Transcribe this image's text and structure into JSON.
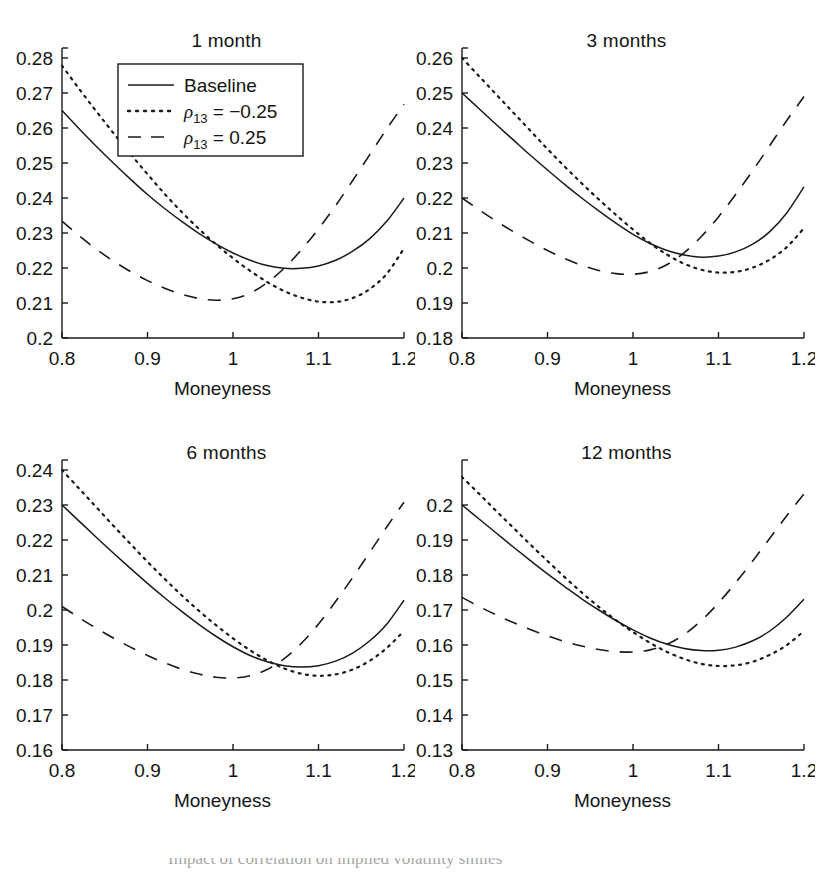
{
  "figure": {
    "background": "#ffffff",
    "line_color": "#1a1a1a",
    "caption_partial": "Impact of correlation on implied volatility smiles"
  },
  "legend": {
    "position": "upper-left-of-first-panel",
    "entries": [
      {
        "label": "Baseline",
        "style": "solid"
      },
      {
        "label": "ρ₁₃ = −0.25",
        "style": "dotted"
      },
      {
        "label": "ρ₁₃ = 0.25",
        "style": "dashed"
      }
    ],
    "entry_0_label": "Baseline",
    "entry_1_rho": "ρ",
    "entry_1_sub": "13",
    "entry_1_value": "= −0.25",
    "entry_2_rho": "ρ",
    "entry_2_sub": "13",
    "entry_2_value": "= 0.25"
  },
  "panels": {
    "p1": {
      "title": "1 month",
      "xlabel": "Moneyness",
      "xticks": [
        "0.8",
        "0.9",
        "1",
        "1.1",
        "1.2"
      ],
      "yticks": [
        "0.2",
        "0.21",
        "0.22",
        "0.23",
        "0.24",
        "0.25",
        "0.26",
        "0.27",
        "0.28"
      ]
    },
    "p2": {
      "title": "3 months",
      "xlabel": "Moneyness",
      "xticks": [
        "0.8",
        "0.9",
        "1",
        "1.1",
        "1.2"
      ],
      "yticks": [
        "0.18",
        "0.19",
        "0.2",
        "0.21",
        "0.22",
        "0.23",
        "0.24",
        "0.25",
        "0.26"
      ]
    },
    "p3": {
      "title": "6 months",
      "xlabel": "Moneyness",
      "xticks": [
        "0.8",
        "0.9",
        "1",
        "1.1",
        "1.2"
      ],
      "yticks": [
        "0.16",
        "0.17",
        "0.18",
        "0.19",
        "0.2",
        "0.21",
        "0.22",
        "0.23",
        "0.24"
      ]
    },
    "p4": {
      "title": "12 months",
      "xlabel": "Moneyness",
      "xticks": [
        "0.13",
        "0.14",
        "0.15",
        "0.16",
        "0.17",
        "0.18",
        "0.19",
        "0.2"
      ]
    }
  },
  "chart_data": [
    {
      "type": "line",
      "title": "1 month",
      "xlabel": "Moneyness",
      "ylabel": "",
      "xlim": [
        0.8,
        1.2
      ],
      "ylim": [
        0.2,
        0.28
      ],
      "xticks": [
        0.8,
        0.9,
        1.0,
        1.1,
        1.2
      ],
      "yticks": [
        0.2,
        0.21,
        0.22,
        0.23,
        0.24,
        0.25,
        0.26,
        0.27,
        0.28
      ],
      "grid": false,
      "legend": "upper-center-inside",
      "x": [
        0.8,
        0.82,
        0.84,
        0.86,
        0.88,
        0.9,
        0.92,
        0.94,
        0.96,
        0.98,
        1.0,
        1.02,
        1.04,
        1.06,
        1.08,
        1.1,
        1.12,
        1.14,
        1.16,
        1.18,
        1.2
      ],
      "series": [
        {
          "name": "Baseline",
          "style": "solid",
          "values": [
            0.265,
            0.2598,
            0.2548,
            0.25,
            0.2454,
            0.241,
            0.237,
            0.2333,
            0.2299,
            0.2269,
            0.2243,
            0.2222,
            0.2207,
            0.2199,
            0.2199,
            0.2206,
            0.2222,
            0.2248,
            0.2284,
            0.2334,
            0.24
          ]
        },
        {
          "name": "ρ₁₃ = −0.25",
          "style": "dotted",
          "values": [
            0.2778,
            0.2712,
            0.2648,
            0.2586,
            0.2526,
            0.2468,
            0.2412,
            0.236,
            0.2312,
            0.2268,
            0.2228,
            0.2192,
            0.216,
            0.2134,
            0.2115,
            0.2104,
            0.2103,
            0.2114,
            0.214,
            0.2184,
            0.2256
          ]
        },
        {
          "name": "ρ₁₃ = 0.25",
          "style": "dashed",
          "values": [
            0.2334,
            0.2292,
            0.2254,
            0.222,
            0.219,
            0.2164,
            0.2142,
            0.2125,
            0.2113,
            0.2108,
            0.2112,
            0.2128,
            0.2158,
            0.22,
            0.2252,
            0.2312,
            0.2378,
            0.245,
            0.2524,
            0.2598,
            0.2668
          ]
        }
      ]
    },
    {
      "type": "line",
      "title": "3 months",
      "xlabel": "Moneyness",
      "ylabel": "",
      "xlim": [
        0.8,
        1.2
      ],
      "ylim": [
        0.18,
        0.26
      ],
      "xticks": [
        0.8,
        0.9,
        1.0,
        1.1,
        1.2
      ],
      "yticks": [
        0.18,
        0.19,
        0.2,
        0.21,
        0.22,
        0.23,
        0.24,
        0.25,
        0.26
      ],
      "grid": false,
      "legend": "none",
      "x": [
        0.8,
        0.82,
        0.84,
        0.86,
        0.88,
        0.9,
        0.92,
        0.94,
        0.96,
        0.98,
        1.0,
        1.02,
        1.04,
        1.06,
        1.08,
        1.1,
        1.12,
        1.14,
        1.16,
        1.18,
        1.2
      ],
      "series": [
        {
          "name": "Baseline",
          "style": "solid",
          "values": [
            0.25,
            0.2455,
            0.241,
            0.2366,
            0.2322,
            0.228,
            0.2239,
            0.22,
            0.2163,
            0.2128,
            0.2096,
            0.207,
            0.205,
            0.2037,
            0.2031,
            0.2034,
            0.2046,
            0.2068,
            0.2104,
            0.2158,
            0.2232
          ]
        },
        {
          "name": "ρ₁₃ = −0.25",
          "style": "dotted",
          "values": [
            0.26,
            0.2548,
            0.2496,
            0.2444,
            0.2392,
            0.234,
            0.229,
            0.2242,
            0.2196,
            0.2152,
            0.211,
            0.2071,
            0.2038,
            0.2012,
            0.1995,
            0.1987,
            0.1989,
            0.2001,
            0.2024,
            0.206,
            0.2114
          ]
        },
        {
          "name": "ρ₁₃ = 0.25",
          "style": "dashed",
          "values": [
            0.22,
            0.2166,
            0.2134,
            0.2104,
            0.2076,
            0.205,
            0.2027,
            0.2008,
            0.1993,
            0.1984,
            0.1982,
            0.199,
            0.201,
            0.2044,
            0.209,
            0.2146,
            0.221,
            0.2278,
            0.235,
            0.2422,
            0.249
          ]
        }
      ]
    },
    {
      "type": "line",
      "title": "6 months",
      "xlabel": "Moneyness",
      "ylabel": "",
      "xlim": [
        0.8,
        1.2
      ],
      "ylim": [
        0.16,
        0.24
      ],
      "xticks": [
        0.8,
        0.9,
        1.0,
        1.1,
        1.2
      ],
      "yticks": [
        0.16,
        0.17,
        0.18,
        0.19,
        0.2,
        0.21,
        0.22,
        0.23,
        0.24
      ],
      "grid": false,
      "legend": "none",
      "x": [
        0.8,
        0.82,
        0.84,
        0.86,
        0.88,
        0.9,
        0.92,
        0.94,
        0.96,
        0.98,
        1.0,
        1.02,
        1.04,
        1.06,
        1.08,
        1.1,
        1.12,
        1.14,
        1.16,
        1.18,
        1.2
      ],
      "series": [
        {
          "name": "Baseline",
          "style": "solid",
          "values": [
            0.23,
            0.2254,
            0.2208,
            0.2163,
            0.2119,
            0.2076,
            0.2035,
            0.1996,
            0.1959,
            0.1925,
            0.1895,
            0.187,
            0.1852,
            0.1841,
            0.1837,
            0.1841,
            0.1854,
            0.1877,
            0.1912,
            0.196,
            0.2028
          ]
        },
        {
          "name": "ρ₁₃ = −0.25",
          "style": "dotted",
          "values": [
            0.24,
            0.2347,
            0.2294,
            0.2241,
            0.2189,
            0.2138,
            0.2089,
            0.2042,
            0.1998,
            0.1957,
            0.1919,
            0.1885,
            0.1856,
            0.1833,
            0.1818,
            0.1812,
            0.1816,
            0.183,
            0.1855,
            0.1892,
            0.194
          ]
        },
        {
          "name": "ρ₁₃ = 0.25",
          "style": "dashed",
          "values": [
            0.201,
            0.1978,
            0.1948,
            0.192,
            0.1894,
            0.187,
            0.1849,
            0.1831,
            0.1817,
            0.1808,
            0.1806,
            0.1812,
            0.183,
            0.1861,
            0.1905,
            0.196,
            0.2024,
            0.2093,
            0.2165,
            0.2238,
            0.2308
          ]
        }
      ]
    },
    {
      "type": "line",
      "title": "12 months",
      "xlabel": "Moneyness",
      "ylabel": "",
      "xlim": [
        0.8,
        1.2
      ],
      "ylim": [
        0.13,
        0.21
      ],
      "xticks": [
        0.8,
        0.9,
        1.0,
        1.1,
        1.2
      ],
      "yticks": [
        0.13,
        0.14,
        0.15,
        0.16,
        0.17,
        0.18,
        0.19,
        0.2
      ],
      "grid": false,
      "legend": "none",
      "x": [
        0.8,
        0.82,
        0.84,
        0.86,
        0.88,
        0.9,
        0.92,
        0.94,
        0.96,
        0.98,
        1.0,
        1.02,
        1.04,
        1.06,
        1.08,
        1.1,
        1.12,
        1.14,
        1.16,
        1.18,
        1.2
      ],
      "series": [
        {
          "name": "Baseline",
          "style": "solid",
          "values": [
            0.2,
            0.196,
            0.192,
            0.188,
            0.1841,
            0.1803,
            0.1767,
            0.1732,
            0.17,
            0.167,
            0.1643,
            0.162,
            0.1602,
            0.159,
            0.1584,
            0.1585,
            0.1594,
            0.1612,
            0.164,
            0.168,
            0.1731
          ]
        },
        {
          "name": "ρ₁₃ = −0.25",
          "style": "dotted",
          "values": [
            0.208,
            0.2032,
            0.1983,
            0.1935,
            0.1887,
            0.184,
            0.1794,
            0.175,
            0.1709,
            0.1671,
            0.1637,
            0.1606,
            0.158,
            0.156,
            0.1546,
            0.154,
            0.1542,
            0.1552,
            0.1572,
            0.16,
            0.164
          ]
        },
        {
          "name": "ρ₁₃ = 0.25",
          "style": "dashed",
          "values": [
            0.1736,
            0.171,
            0.1686,
            0.1664,
            0.1644,
            0.1626,
            0.161,
            0.1597,
            0.1587,
            0.1581,
            0.158,
            0.1586,
            0.1602,
            0.163,
            0.167,
            0.172,
            0.1778,
            0.184,
            0.1905,
            0.197,
            0.2032
          ]
        }
      ]
    }
  ]
}
